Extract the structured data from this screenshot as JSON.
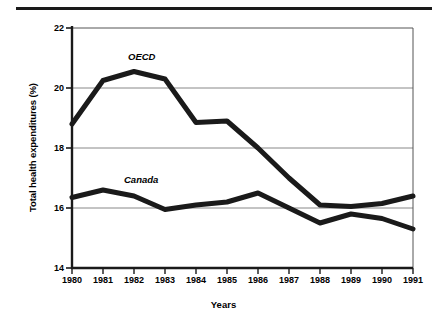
{
  "figure": {
    "xlabel": "Years",
    "ylabel": "Total health expenditures (%)",
    "series_labels": {
      "oecd": "OECD",
      "canada": "Canada"
    },
    "yticks": [
      "22",
      "20",
      "18",
      "16",
      "14"
    ],
    "xticks": [
      "1980",
      "1981",
      "1982",
      "1983",
      "1984",
      "1985",
      "1986",
      "1987",
      "1988",
      "1989",
      "1990",
      "1991"
    ],
    "colors": {
      "line": "#1a1a1a",
      "grid": "#808080",
      "axis": "#1a1a1a",
      "background": "#ffffff"
    }
  },
  "chart_data": {
    "type": "line",
    "title": "",
    "xlabel": "Years",
    "ylabel": "Total health expenditures (%)",
    "x": [
      1980,
      1981,
      1982,
      1983,
      1984,
      1985,
      1986,
      1987,
      1988,
      1989,
      1990,
      1991
    ],
    "categories": [
      "1980",
      "1981",
      "1982",
      "1983",
      "1984",
      "1985",
      "1986",
      "1987",
      "1988",
      "1989",
      "1990",
      "1991"
    ],
    "series": [
      {
        "name": "OECD",
        "values": [
          18.8,
          20.25,
          20.55,
          20.3,
          18.85,
          18.9,
          18.0,
          17.0,
          16.1,
          16.05,
          16.15,
          16.4
        ]
      },
      {
        "name": "Canada",
        "values": [
          16.35,
          16.6,
          16.4,
          15.95,
          16.1,
          16.2,
          16.5,
          16.0,
          15.5,
          15.8,
          15.65,
          15.3
        ]
      }
    ],
    "ylim": [
      14,
      22
    ],
    "xlim": [
      1980,
      1991
    ],
    "ytick_values": [
      14,
      16,
      18,
      20,
      22
    ],
    "grid": "horizontal",
    "legend": "inline-annotations",
    "annotations": [
      {
        "text": "OECD",
        "x": 1982,
        "y": 21.1
      },
      {
        "text": "Canada",
        "x": 1982.4,
        "y": 17.35
      }
    ]
  }
}
